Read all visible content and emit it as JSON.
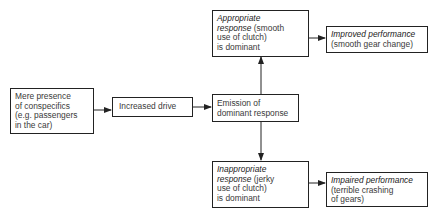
{
  "nodes": {
    "presence": {
      "line1": "Mere presence",
      "line2": "of conspecifics",
      "line3": "(e.g. passengers",
      "line4": "in the car)"
    },
    "drive": {
      "label": "Increased drive"
    },
    "emission": {
      "line1": "Emission of",
      "line2": "dominant response"
    },
    "appropriate": {
      "italic1": "Appropriate",
      "italic2": "response",
      "rest2": " (smooth",
      "line3": "use of clutch)",
      "line4": "is dominant"
    },
    "improved": {
      "italic1": "Improved performance",
      "line2": "(smooth gear change)"
    },
    "inappropriate": {
      "italic1": "Inappropriate",
      "italic2": "response",
      "rest2": " (jerky",
      "line3": "use of clutch)",
      "line4": "is dominant"
    },
    "impaired": {
      "italic1": "Impaired performance",
      "line2": "(terrible crashing",
      "line3": "of gears)"
    }
  },
  "edges": [
    {
      "from": "presence",
      "to": "drive"
    },
    {
      "from": "drive",
      "to": "emission"
    },
    {
      "from": "emission",
      "to": "appropriate"
    },
    {
      "from": "emission",
      "to": "inappropriate"
    },
    {
      "from": "appropriate",
      "to": "improved"
    },
    {
      "from": "inappropriate",
      "to": "impaired"
    }
  ]
}
